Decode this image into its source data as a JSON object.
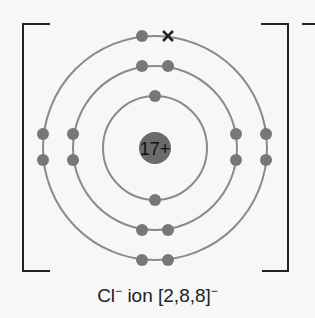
{
  "nucleus": {
    "label": "17+",
    "color": "#6b6b6b"
  },
  "shells": [
    {
      "radius": 52,
      "electrons": 2
    },
    {
      "radius": 82,
      "electrons": 8
    },
    {
      "radius": 112,
      "electrons": 8
    }
  ],
  "gained_electron_marker": "×",
  "caption": {
    "symbol": "Cl",
    "charge": "−",
    "text": " ion [2,8,8]",
    "bracket_charge": "−"
  },
  "outer_bracket_charge": "−",
  "colors": {
    "shell": "#8a8a8a",
    "electron": "#777777",
    "bracket": "#222222"
  }
}
